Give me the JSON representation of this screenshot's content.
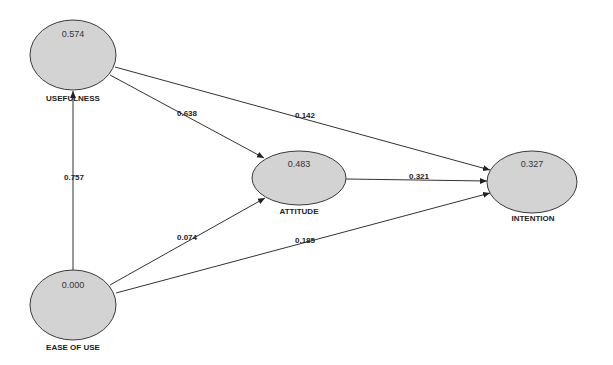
{
  "diagram": {
    "type": "path-model",
    "nodes": [
      {
        "id": "usefulness",
        "label": "USEFULNESS",
        "value": "0.574"
      },
      {
        "id": "attitude",
        "label": "ATTITUDE",
        "value": "0.483"
      },
      {
        "id": "intention",
        "label": "INTENTION",
        "value": "0.327"
      },
      {
        "id": "ease_of_use",
        "label": "EASE OF USE",
        "value": "0.000"
      }
    ],
    "edges": [
      {
        "from": "ease_of_use",
        "to": "usefulness",
        "coefficient": "0.757"
      },
      {
        "from": "usefulness",
        "to": "attitude",
        "coefficient": "0.638"
      },
      {
        "from": "usefulness",
        "to": "intention",
        "coefficient": "0.142"
      },
      {
        "from": "attitude",
        "to": "intention",
        "coefficient": "0.321"
      },
      {
        "from": "ease_of_use",
        "to": "attitude",
        "coefficient": "0.074"
      },
      {
        "from": "ease_of_use",
        "to": "intention",
        "coefficient": "0.185"
      }
    ],
    "colors": {
      "node_fill": "#d3d3d3",
      "node_stroke": "#3a3a3a",
      "edge": "#333333",
      "background": "#ffffff"
    }
  }
}
